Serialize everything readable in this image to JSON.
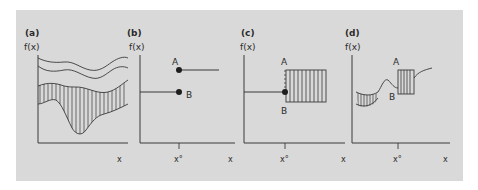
{
  "figure": {
    "background": "#d9d9d9",
    "stroke_color": "#3a3a3a",
    "panels": [
      {
        "id": "a",
        "label": "(a)",
        "y_axis_label": "f(x)",
        "x_axis_label": "x"
      },
      {
        "id": "b",
        "label": "(b)",
        "y_axis_label": "f(x)",
        "x_axis_label": "x",
        "x_tick_label": "x°",
        "point_a_label": "A",
        "point_b_label": "B"
      },
      {
        "id": "c",
        "label": "(c)",
        "y_axis_label": "f(x)",
        "x_axis_label": "x",
        "x_tick_label": "x°",
        "point_a_label": "A",
        "point_b_label": "B"
      },
      {
        "id": "d",
        "label": "(d)",
        "y_axis_label": "f(x)",
        "x_axis_label": "x",
        "x_tick_label": "x°",
        "point_a_label": "A",
        "point_b_label": "B"
      }
    ]
  }
}
